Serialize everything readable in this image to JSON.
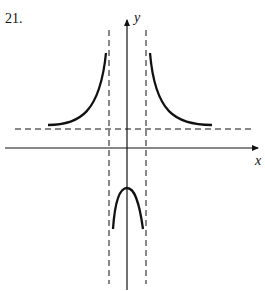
{
  "problem": {
    "number": "21."
  },
  "axes": {
    "x_label": "x",
    "y_label": "y"
  },
  "graph": {
    "description": "Graph of a rational function with two vertical asymptotes symmetric about the y-axis and a horizontal asymptote above the x-axis",
    "vertical_asymptotes": [
      "x = -a",
      "x = a"
    ],
    "horizontal_asymptote": "y = b (b > 0)",
    "branches": [
      {
        "name": "left-branch",
        "shape": "increasing toward left vertical asymptote, approaching horizontal asymptote from above as x -> -inf"
      },
      {
        "name": "right-branch",
        "shape": "decreasing from right vertical asymptote, approaching horizontal asymptote from above as x -> +inf"
      },
      {
        "name": "middle-branch",
        "shape": "downward arch between asymptotes with maximum below x-axis on y-axis"
      }
    ]
  },
  "colors": {
    "stroke": "#111111",
    "background": "#ffffff"
  }
}
